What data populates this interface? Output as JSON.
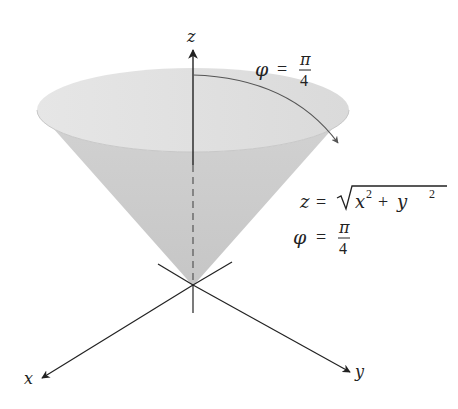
{
  "figure": {
    "width": 458,
    "height": 409,
    "colors": {
      "background": "#ffffff",
      "cone_top": "#e0e0e0",
      "cone_body": "#cccccc",
      "axis": "#222222",
      "arc": "#555555",
      "text": "#222222"
    }
  },
  "axes": {
    "z_label": "z",
    "x_label": "x",
    "y_label": "y"
  },
  "annotations": {
    "angle_label": {
      "lhs": "φ",
      "eq": "=",
      "num": "π",
      "den": "4"
    },
    "cone_equation": {
      "lhs": "z",
      "eq": "=",
      "radical_x": "x",
      "sup_x": "2",
      "plus": "+",
      "radical_y": "y",
      "sup_y": "2"
    },
    "cone_angle": {
      "lhs": "φ",
      "eq": "=",
      "num": "π",
      "den": "4"
    }
  }
}
